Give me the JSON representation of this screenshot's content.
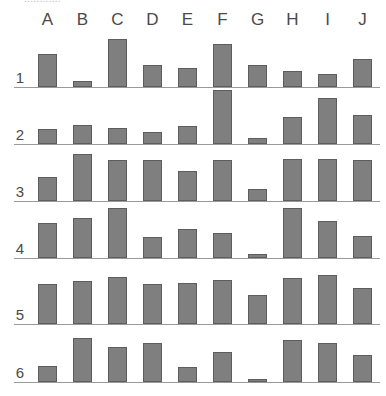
{
  "top_caption_clipped": "............",
  "chart_data": {
    "type": "bar",
    "title": "",
    "subtitle": "",
    "xlabel": "",
    "ylabel": "",
    "grid": false,
    "legend": "none",
    "layout": "6 stacked row panels (rows 1-6), each a bar chart over categories A-J sharing a common baseline",
    "categories": [
      "A",
      "B",
      "C",
      "D",
      "E",
      "F",
      "G",
      "H",
      "I",
      "J"
    ],
    "row_labels": [
      "1",
      "2",
      "3",
      "4",
      "5",
      "6"
    ],
    "ylim": [
      0,
      56
    ],
    "series": [
      {
        "name": "1",
        "values": [
          33,
          6,
          48,
          22,
          19,
          43,
          22,
          16,
          13,
          28
        ]
      },
      {
        "name": "2",
        "values": [
          15,
          19,
          16,
          12,
          18,
          54,
          6,
          27,
          46,
          29
        ]
      },
      {
        "name": "3",
        "values": [
          24,
          47,
          41,
          41,
          30,
          41,
          12,
          42,
          42,
          41
        ]
      },
      {
        "name": "4",
        "values": [
          35,
          40,
          50,
          21,
          29,
          25,
          4,
          50,
          37,
          22
        ]
      },
      {
        "name": "5",
        "values": [
          40,
          43,
          47,
          40,
          41,
          44,
          29,
          46,
          49,
          36
        ]
      },
      {
        "name": "6",
        "values": [
          16,
          44,
          35,
          39,
          15,
          30,
          3,
          42,
          39,
          27
        ]
      }
    ]
  },
  "colors": {
    "bar_fill": "#7f7f7f",
    "bar_stroke": "#5d5d5d",
    "axis": "#9a9a9a",
    "text": "#4a4a4a",
    "background": "#ffffff"
  }
}
